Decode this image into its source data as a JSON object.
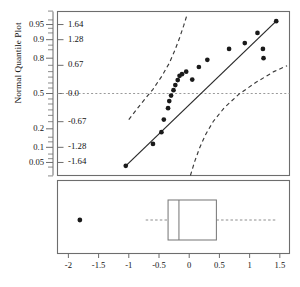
{
  "chart_data": {
    "type": "scatter",
    "title": "",
    "ylabel": "Normal Quantile Plot",
    "xlabel": "",
    "xlim": [
      -2.18,
      1.66
    ],
    "xticks": [
      -2,
      -1.5,
      -1,
      -0.5,
      0,
      0.5,
      1,
      1.5
    ],
    "xticklabels": [
      "-2",
      "-1.5",
      "-1",
      "-0.5",
      "0",
      "0.5",
      "1",
      "1.5"
    ],
    "grid": false,
    "zlim": [
      -1.95,
      1.95
    ],
    "prob_ticks": [
      0.95,
      0.9,
      0.8,
      0.5,
      0.2,
      0.1,
      0.05
    ],
    "prob_ticklabels": [
      "0.95",
      "0.9",
      "0.8",
      "0.5",
      "0.2",
      "0.1",
      "0.05"
    ],
    "prob_tick_z": [
      1.64,
      1.28,
      0.84,
      0.0,
      -0.84,
      -1.28,
      -1.64
    ],
    "minor_prob_tick_z": [
      1.96,
      1.75,
      1.55,
      1.44,
      1.15,
      1.04,
      0.67,
      0.52,
      0.39,
      0.25,
      0.13,
      -0.13,
      -0.25,
      -0.39,
      -0.52,
      -0.67,
      -1.04,
      -1.15,
      -1.44,
      -1.55,
      -1.75,
      -1.96
    ],
    "z_ticklabels": [
      "1.64",
      "1.28",
      "0.67",
      "0.0",
      "-0.67",
      "-1.28",
      "-1.64"
    ],
    "z_tick_values": [
      1.64,
      1.28,
      0.67,
      0.0,
      -0.67,
      -1.28,
      -1.64
    ],
    "reference_line_z": 0.0,
    "fit_line": {
      "x0": -1.05,
      "z0": -1.72,
      "x1": 1.44,
      "z1": 1.72
    },
    "points": [
      {
        "x": -1.05,
        "z": -1.72
      },
      {
        "x": -0.6,
        "z": -1.2
      },
      {
        "x": -0.46,
        "z": -0.92
      },
      {
        "x": -0.42,
        "z": -0.62
      },
      {
        "x": -0.35,
        "z": -0.35
      },
      {
        "x": -0.33,
        "z": -0.18
      },
      {
        "x": -0.3,
        "z": -0.05
      },
      {
        "x": -0.26,
        "z": 0.08
      },
      {
        "x": -0.23,
        "z": 0.2
      },
      {
        "x": -0.19,
        "z": 0.32
      },
      {
        "x": -0.16,
        "z": 0.42
      },
      {
        "x": -0.12,
        "z": 0.46
      },
      {
        "x": -0.05,
        "z": 0.52
      },
      {
        "x": 0.05,
        "z": 0.33
      },
      {
        "x": 0.16,
        "z": 0.63
      },
      {
        "x": 0.3,
        "z": 0.8
      },
      {
        "x": 0.66,
        "z": 1.06
      },
      {
        "x": 0.92,
        "z": 1.2
      },
      {
        "x": 1.13,
        "z": 1.44
      },
      {
        "x": 1.22,
        "z": 1.06
      },
      {
        "x": 1.23,
        "z": 0.84
      },
      {
        "x": 1.44,
        "z": 1.72
      }
    ],
    "confidence_bands": {
      "upper": [
        {
          "x": -1.0,
          "z": -0.62
        },
        {
          "x": -0.8,
          "z": -0.25
        },
        {
          "x": -0.6,
          "z": 0.1
        },
        {
          "x": -0.45,
          "z": 0.42
        },
        {
          "x": -0.33,
          "z": 0.72
        },
        {
          "x": -0.24,
          "z": 1.02
        },
        {
          "x": -0.16,
          "z": 1.32
        },
        {
          "x": -0.09,
          "z": 1.62
        },
        {
          "x": -0.03,
          "z": 1.9
        }
      ],
      "lower": [
        {
          "x": 0.02,
          "z": -1.95
        },
        {
          "x": 0.09,
          "z": -1.62
        },
        {
          "x": 0.17,
          "z": -1.3
        },
        {
          "x": 0.27,
          "z": -0.98
        },
        {
          "x": 0.4,
          "z": -0.66
        },
        {
          "x": 0.58,
          "z": -0.34
        },
        {
          "x": 0.82,
          "z": -0.02
        },
        {
          "x": 1.1,
          "z": 0.26
        },
        {
          "x": 1.4,
          "z": 0.52
        },
        {
          "x": 1.62,
          "z": 0.66
        }
      ]
    },
    "boxplot": {
      "min_whisker": -0.72,
      "q1": -0.35,
      "median": -0.17,
      "q3": 0.45,
      "max_whisker": 1.44,
      "outliers": [
        -1.81
      ]
    },
    "colors": {
      "frame": "#6d6d6d",
      "point": "#1a1a1a",
      "fit_line": "#2b2b2b",
      "band": "#3a3a3a",
      "reference": "#9a9a9a",
      "whisker": "#8d8d8d",
      "box": "#7a7a7a"
    }
  }
}
